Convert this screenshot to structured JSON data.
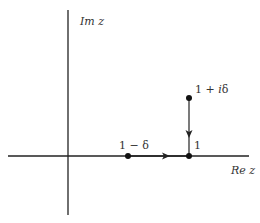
{
  "diagram": {
    "type": "complex-plane-contour",
    "axes": {
      "horizontal_label": "Re z",
      "vertical_label": "Im z",
      "color": "#222222"
    },
    "points": [
      {
        "id": "one-minus-delta",
        "label": "1 − δ",
        "x": 128,
        "y": 156
      },
      {
        "id": "one",
        "label": "1",
        "x": 189,
        "y": 156
      },
      {
        "id": "one-plus-i-delta",
        "label": "1 + iδ",
        "x": 189,
        "y": 98
      }
    ],
    "paths": [
      {
        "from": "one-minus-delta",
        "to": "one",
        "direction": "right"
      },
      {
        "from": "one-plus-i-delta",
        "to": "one",
        "direction": "down"
      }
    ],
    "labels": {
      "im_z": "Im z",
      "re_z": "Re z",
      "one_minus_delta": "1 − δ",
      "one": "1",
      "one_plus_i_delta_prefix": "1 + ",
      "one_plus_i_delta_i": "i",
      "one_plus_i_delta_delta": "δ"
    }
  }
}
